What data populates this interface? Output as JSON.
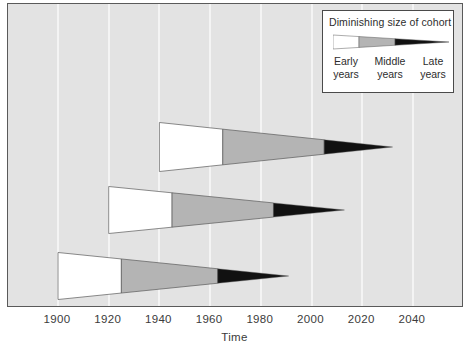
{
  "chart_data": {
    "type": "area",
    "title": "",
    "xlabel": "Time",
    "ylabel": "",
    "xlim": [
      1890,
      2070
    ],
    "grid": true,
    "tick_labels": [
      "1900",
      "1920",
      "1940",
      "1960",
      "1980",
      "2000",
      "2020",
      "2040"
    ],
    "tick_values": [
      1900,
      1920,
      1940,
      1960,
      1980,
      2000,
      2020,
      2040
    ],
    "legend_position": "top-right",
    "series": [
      {
        "name": "Cohort 3 (top)",
        "start": 1940,
        "early_end": 1965,
        "middle_end": 2005,
        "end": 2032,
        "row": 0
      },
      {
        "name": "Cohort 2 (middle)",
        "start": 1920,
        "early_end": 1945,
        "middle_end": 1985,
        "end": 2013,
        "row": 1
      },
      {
        "name": "Cohort 1 (bottom)",
        "start": 1900,
        "early_end": 1925,
        "middle_end": 1963,
        "end": 1991,
        "row": 2
      }
    ],
    "segment_names": [
      "Early years",
      "Middle years",
      "Late years"
    ],
    "segment_colors": [
      "#ffffff",
      "#b4b4b4",
      "#111111"
    ]
  },
  "legend": {
    "title": "Diminishing size of cohort",
    "items": [
      {
        "line1": "Early",
        "line2": "years"
      },
      {
        "line1": "Middle",
        "line2": "years"
      },
      {
        "line1": "Late",
        "line2": "years"
      }
    ]
  },
  "axis": {
    "x_title": "Time",
    "ticks": [
      "1900",
      "1920",
      "1940",
      "1960",
      "1980",
      "2000",
      "2020",
      "2040"
    ]
  },
  "colors": {
    "plot_background": "#e3e3e3",
    "gridline": "#f4f4f4",
    "early": "#ffffff",
    "middle": "#b4b4b4",
    "late": "#111111",
    "outline": "#5a5a5a",
    "text": "#3b3b3b"
  }
}
